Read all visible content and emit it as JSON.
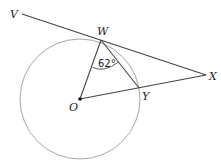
{
  "diagram": {
    "type": "geometry",
    "colors": {
      "line": "#444444",
      "circle": "#a8a8a8",
      "text": "#222222"
    },
    "points": {
      "V": {
        "label": "V",
        "x": 22,
        "y": 14
      },
      "W": {
        "label": "W",
        "x": 101,
        "y": 40
      },
      "X": {
        "label": "X",
        "x": 206,
        "y": 75
      },
      "Y": {
        "label": "Y",
        "x": 139,
        "y": 88
      },
      "O": {
        "label": "O",
        "x": 80,
        "y": 99
      }
    },
    "circle": {
      "center": "O",
      "radius": 60
    },
    "segments": [
      {
        "from": "V",
        "to": "X"
      },
      {
        "from": "O",
        "to": "W"
      },
      {
        "from": "W",
        "to": "Y"
      },
      {
        "from": "O",
        "to": "X"
      }
    ],
    "angle": {
      "vertex": "W",
      "between": [
        "O",
        "Y"
      ],
      "label": "62°"
    }
  }
}
